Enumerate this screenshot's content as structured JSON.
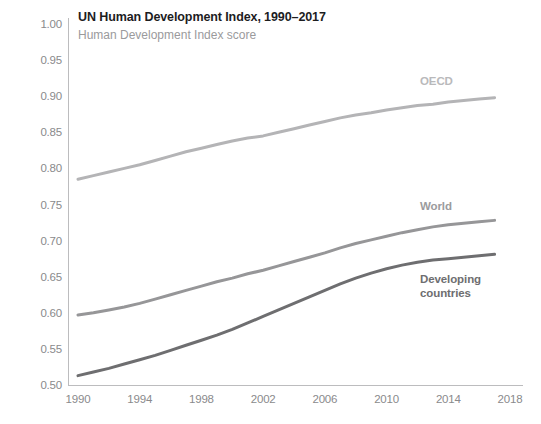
{
  "header": {
    "title": "UN Human Development Index, 1990–2017",
    "subtitle": "Human Development Index score"
  },
  "axes": {
    "y_ticks": [
      "1.00",
      "0.95",
      "0.90",
      "0.85",
      "0.80",
      "0.75",
      "0.70",
      "0.65",
      "0.60",
      "0.55",
      "0.50"
    ],
    "x_ticks": [
      "1990",
      "1994",
      "1998",
      "2002",
      "2006",
      "2010",
      "2014",
      "2018"
    ]
  },
  "series_labels": {
    "oecd": "OECD",
    "world": "World",
    "developing": "Developing\ncountries"
  },
  "chart_data": {
    "type": "line",
    "title": "UN Human Development Index, 1990–2017",
    "subtitle": "Human Development Index score",
    "xlabel": "",
    "ylabel": "Human Development Index score",
    "xlim": [
      1990,
      2018
    ],
    "ylim": [
      0.5,
      1.0
    ],
    "ytick_step": 0.05,
    "xtick_step": 4,
    "grid": false,
    "legend": "inline-end-of-line",
    "x": [
      1990,
      1991,
      1992,
      1993,
      1994,
      1995,
      1996,
      1997,
      1998,
      1999,
      2000,
      2001,
      2002,
      2003,
      2004,
      2005,
      2006,
      2007,
      2008,
      2009,
      2010,
      2011,
      2012,
      2013,
      2014,
      2015,
      2016,
      2017
    ],
    "series": [
      {
        "name": "OECD",
        "color": "#b4b4b6",
        "values": [
          0.785,
          0.79,
          0.795,
          0.8,
          0.805,
          0.811,
          0.817,
          0.823,
          0.828,
          0.833,
          0.838,
          0.842,
          0.845,
          0.85,
          0.855,
          0.86,
          0.865,
          0.87,
          0.874,
          0.877,
          0.881,
          0.884,
          0.887,
          0.889,
          0.892,
          0.894,
          0.896,
          0.898
        ]
      },
      {
        "name": "World",
        "color": "#969698",
        "values": [
          0.597,
          0.6,
          0.604,
          0.608,
          0.613,
          0.619,
          0.625,
          0.631,
          0.637,
          0.643,
          0.648,
          0.654,
          0.659,
          0.665,
          0.671,
          0.677,
          0.683,
          0.69,
          0.696,
          0.701,
          0.706,
          0.711,
          0.715,
          0.719,
          0.722,
          0.724,
          0.726,
          0.728
        ]
      },
      {
        "name": "Developing countries",
        "color": "#6e6e70",
        "values": [
          0.513,
          0.518,
          0.523,
          0.529,
          0.535,
          0.541,
          0.548,
          0.555,
          0.562,
          0.569,
          0.577,
          0.586,
          0.595,
          0.604,
          0.613,
          0.622,
          0.631,
          0.64,
          0.648,
          0.655,
          0.661,
          0.666,
          0.67,
          0.673,
          0.675,
          0.677,
          0.679,
          0.681
        ]
      }
    ]
  }
}
